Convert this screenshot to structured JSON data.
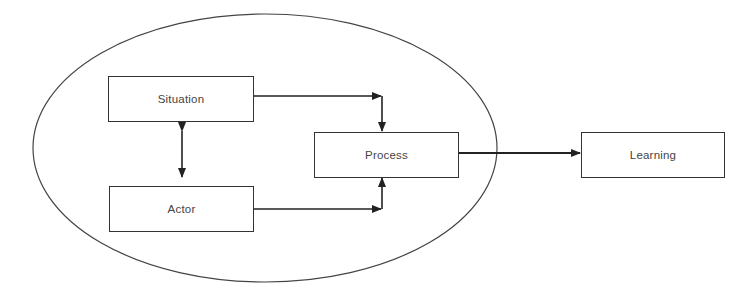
{
  "diagram": {
    "boundary": {
      "shape": "ellipse",
      "label": ""
    },
    "nodes": [
      {
        "id": "situation",
        "label": "Situation"
      },
      {
        "id": "actor",
        "label": "Actor"
      },
      {
        "id": "process",
        "label": "Process"
      },
      {
        "id": "learning",
        "label": "Learning"
      }
    ],
    "edges": [
      {
        "from": "situation",
        "to": "actor",
        "type": "bidirectional"
      },
      {
        "from": "situation",
        "to": "process",
        "type": "directed"
      },
      {
        "from": "actor",
        "to": "process",
        "type": "directed"
      },
      {
        "from": "process",
        "to": "learning",
        "type": "directed"
      }
    ],
    "colors": {
      "stroke": "#333333",
      "text": "#444444",
      "background": "#ffffff"
    }
  }
}
